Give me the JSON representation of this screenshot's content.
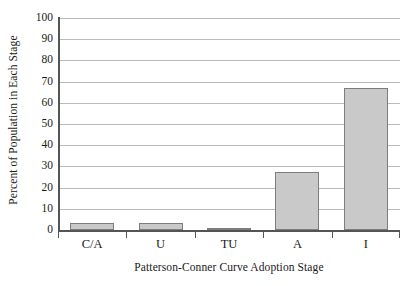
{
  "chart_data": {
    "type": "bar",
    "title": "",
    "xlabel": "Patterson-Conner Curve Adoption Stage",
    "ylabel": "Percent of Population in Each Stage",
    "categories": [
      "C/A",
      "U",
      "TU",
      "A",
      "I"
    ],
    "values": [
      3.5,
      3.5,
      0.5,
      27.5,
      67
    ],
    "series": [
      {
        "name": "Percent of Population in Each Stage",
        "values": [
          3.5,
          3.5,
          0.5,
          27.5,
          67
        ]
      }
    ],
    "ylim": [
      0,
      100
    ],
    "ytick_labels": [
      "0",
      "10",
      "20",
      "30",
      "40",
      "50",
      "60",
      "70",
      "80",
      "90",
      "100"
    ],
    "ytick_values": [
      0,
      10,
      20,
      30,
      40,
      50,
      60,
      70,
      80,
      90,
      100
    ],
    "grid": true,
    "grid_axis": "y",
    "legend": false,
    "legend_position": "none",
    "bar_fill_color": "#c9c9c9",
    "bar_edge_color": "#7d7d7d",
    "gridline_color": "#b9b9b9",
    "axis_color": "#555555",
    "background_color": "#ffffff"
  }
}
